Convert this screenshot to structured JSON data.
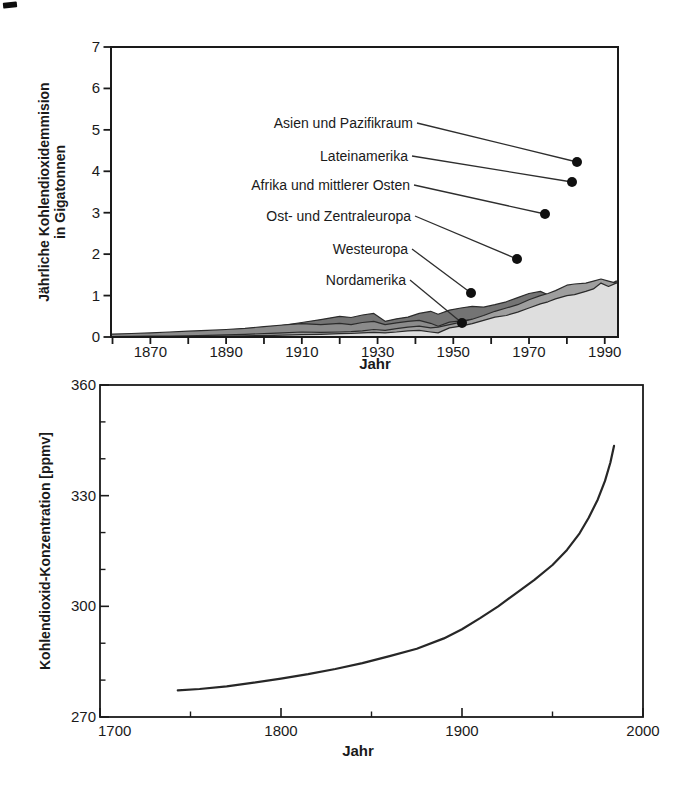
{
  "figure": {
    "background": "#ffffff",
    "ink_color": "#1a1a1a"
  },
  "chart_data": [
    {
      "id": "emissions",
      "type": "area",
      "stacked": true,
      "xlabel": "Jahr",
      "ylabel_lines": [
        "Jährliche Kohlendioxidemmision",
        "in Gigatonnen"
      ],
      "xlim": [
        1859.6,
        1993.5
      ],
      "ylim": [
        0,
        7
      ],
      "x_minor_ticks": [
        1860,
        1870,
        1880,
        1890,
        1900,
        1910,
        1920,
        1930,
        1940,
        1950,
        1960,
        1970,
        1980,
        1990
      ],
      "x_tick_labels": [
        1870,
        1890,
        1910,
        1930,
        1950,
        1970,
        1990
      ],
      "y_ticks": [
        0,
        1,
        2,
        3,
        4,
        5,
        6,
        7
      ],
      "x": [
        1860,
        1865,
        1870,
        1875,
        1880,
        1885,
        1890,
        1895,
        1900,
        1905,
        1910,
        1915,
        1920,
        1923,
        1926,
        1929,
        1932,
        1935,
        1938,
        1941,
        1944,
        1946,
        1949,
        1952,
        1955,
        1958,
        1961,
        1964,
        1967,
        1970,
        1973,
        1975,
        1977,
        1980,
        1982,
        1985,
        1987,
        1989,
        1991,
        1993
      ],
      "series": [
        {
          "name": "Nordamerika",
          "color": "#747474",
          "values": [
            0.01,
            0.02,
            0.03,
            0.045,
            0.06,
            0.09,
            0.13,
            0.16,
            0.2,
            0.28,
            0.35,
            0.42,
            0.5,
            0.47,
            0.53,
            0.57,
            0.38,
            0.44,
            0.48,
            0.57,
            0.62,
            0.55,
            0.65,
            0.7,
            0.74,
            0.72,
            0.78,
            0.85,
            0.95,
            1.05,
            1.1,
            1.02,
            1.08,
            1.15,
            1.08,
            1.12,
            1.18,
            1.3,
            1.25,
            1.35
          ]
        },
        {
          "name": "Westeuropa",
          "color": "#8b8b8b",
          "values": [
            0.07,
            0.085,
            0.1,
            0.12,
            0.14,
            0.16,
            0.18,
            0.21,
            0.25,
            0.29,
            0.32,
            0.3,
            0.33,
            0.3,
            0.35,
            0.38,
            0.3,
            0.34,
            0.38,
            0.4,
            0.33,
            0.26,
            0.36,
            0.39,
            0.42,
            0.44,
            0.47,
            0.5,
            0.53,
            0.58,
            0.6,
            0.56,
            0.59,
            0.62,
            0.57,
            0.58,
            0.6,
            0.63,
            0.64,
            0.68
          ]
        },
        {
          "name": "Ost- und Zentraleuropa",
          "color": "#9e9e9e",
          "values": [
            0.01,
            0.015,
            0.02,
            0.025,
            0.03,
            0.04,
            0.05,
            0.065,
            0.08,
            0.1,
            0.12,
            0.11,
            0.12,
            0.13,
            0.15,
            0.18,
            0.16,
            0.2,
            0.24,
            0.26,
            0.22,
            0.24,
            0.3,
            0.36,
            0.43,
            0.52,
            0.62,
            0.7,
            0.78,
            0.9,
            1.0,
            1.05,
            1.12,
            1.25,
            1.28,
            1.3,
            1.35,
            1.4,
            1.35,
            1.3
          ]
        },
        {
          "name": "Afrika und mittlerer Osten",
          "color": "#b3b3b3",
          "values": [
            0.0,
            0.0,
            0.002,
            0.004,
            0.006,
            0.008,
            0.01,
            0.01,
            0.012,
            0.016,
            0.02,
            0.025,
            0.03,
            0.03,
            0.035,
            0.04,
            0.04,
            0.045,
            0.05,
            0.05,
            0.055,
            0.06,
            0.07,
            0.08,
            0.1,
            0.11,
            0.12,
            0.14,
            0.17,
            0.2,
            0.27,
            0.3,
            0.31,
            0.35,
            0.39,
            0.44,
            0.47,
            0.5,
            0.52,
            0.55
          ]
        },
        {
          "name": "Lateinamerika",
          "color": "#c9c9c9",
          "values": [
            0.0,
            0.0,
            0.002,
            0.004,
            0.006,
            0.008,
            0.01,
            0.012,
            0.015,
            0.018,
            0.022,
            0.026,
            0.03,
            0.032,
            0.036,
            0.04,
            0.04,
            0.046,
            0.052,
            0.058,
            0.065,
            0.07,
            0.08,
            0.09,
            0.11,
            0.12,
            0.14,
            0.155,
            0.18,
            0.22,
            0.26,
            0.28,
            0.3,
            0.34,
            0.35,
            0.36,
            0.365,
            0.37,
            0.375,
            0.38
          ]
        },
        {
          "name": "Asien und Pazifikraum",
          "color": "#dedede",
          "values": [
            0.0,
            0.005,
            0.01,
            0.012,
            0.015,
            0.02,
            0.025,
            0.03,
            0.035,
            0.045,
            0.055,
            0.065,
            0.08,
            0.085,
            0.1,
            0.11,
            0.1,
            0.12,
            0.15,
            0.16,
            0.12,
            0.1,
            0.22,
            0.26,
            0.32,
            0.4,
            0.48,
            0.52,
            0.6,
            0.7,
            0.8,
            0.85,
            0.92,
            1.0,
            1.02,
            1.1,
            1.16,
            1.3,
            1.22,
            1.3
          ]
        }
      ],
      "annotations": [
        {
          "label": "Asien und Pazifikraum",
          "tx": 413,
          "ty": 123,
          "dx": 577,
          "dy": 162
        },
        {
          "label": "Lateinamerika",
          "tx": 408,
          "ty": 156,
          "dx": 572,
          "dy": 182
        },
        {
          "label": "Afrika und mittlerer Osten",
          "tx": 410,
          "ty": 185,
          "dx": 545,
          "dy": 214
        },
        {
          "label": "Ost- und Zentraleuropa",
          "tx": 411,
          "ty": 216,
          "dx": 517,
          "dy": 259
        },
        {
          "label": "Westeuropa",
          "tx": 408,
          "ty": 249,
          "dx": 471,
          "dy": 293
        },
        {
          "label": "Nordamerika",
          "tx": 406,
          "ty": 280,
          "dx": 462,
          "dy": 323
        }
      ]
    },
    {
      "id": "concentration",
      "type": "line",
      "xlabel": "Jahr",
      "ylabel": "Kohlendioxid-Konzentration [ppmv]",
      "xlim": [
        1700,
        2000
      ],
      "ylim": [
        270,
        360
      ],
      "x_major_ticks": [
        1700,
        1800,
        1900,
        2000
      ],
      "x_minor_ticks": [
        1750,
        1850,
        1950
      ],
      "y_major_ticks": [
        270,
        300,
        330,
        360
      ],
      "y_minor_ticks": [
        280,
        290,
        310,
        320,
        340,
        350
      ],
      "line_color": "#272727",
      "points": [
        [
          1743,
          277.2
        ],
        [
          1755,
          277.6
        ],
        [
          1770,
          278.3
        ],
        [
          1785,
          279.3
        ],
        [
          1800,
          280.4
        ],
        [
          1815,
          281.6
        ],
        [
          1830,
          283.0
        ],
        [
          1845,
          284.6
        ],
        [
          1860,
          286.5
        ],
        [
          1875,
          288.5
        ],
        [
          1890,
          291.3
        ],
        [
          1900,
          293.8
        ],
        [
          1910,
          296.8
        ],
        [
          1920,
          300.0
        ],
        [
          1930,
          303.6
        ],
        [
          1940,
          307.2
        ],
        [
          1950,
          311.2
        ],
        [
          1958,
          315.3
        ],
        [
          1965,
          319.8
        ],
        [
          1970,
          324.0
        ],
        [
          1975,
          329.0
        ],
        [
          1979,
          334.0
        ],
        [
          1982,
          339.0
        ],
        [
          1984,
          343.5
        ]
      ]
    }
  ]
}
